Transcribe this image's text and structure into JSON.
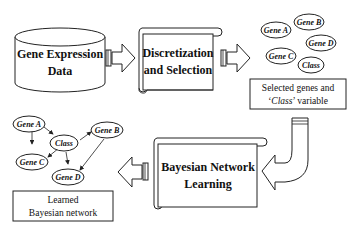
{
  "diagram": {
    "source": {
      "line1": "Gene Expression",
      "line2": "Data"
    },
    "step1": {
      "line1": "Discretization",
      "line2": "and Selection"
    },
    "selected_nodes": [
      "Gene A",
      "Gene B",
      "Gene C",
      "Gene D",
      "Class"
    ],
    "selected_caption": {
      "line1": "Selected genes and",
      "line2_italic": "Class",
      "line2_rest": " variable"
    },
    "step2": {
      "line1": "Bayesian Network",
      "line2": "Learning"
    },
    "learned_nodes": [
      "Gene A",
      "Class",
      "Gene B",
      "Gene C",
      "Gene D"
    ],
    "learned_caption": {
      "line1": "Learned",
      "line2": "Bayesian network"
    },
    "edges": [
      [
        "Gene A",
        "Class"
      ],
      [
        "Gene A",
        "Gene C"
      ],
      [
        "Class",
        "Gene C"
      ],
      [
        "Class",
        "Gene B"
      ],
      [
        "Class",
        "Gene D"
      ],
      [
        "Gene B",
        "Gene D"
      ]
    ]
  }
}
